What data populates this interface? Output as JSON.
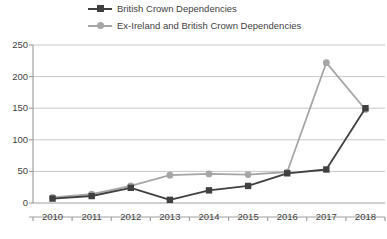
{
  "chart_data": {
    "type": "line",
    "title": "",
    "xlabel": "",
    "ylabel": "",
    "categories": [
      "2010",
      "2011",
      "2012",
      "2013",
      "2014",
      "2015",
      "2016",
      "2017",
      "2018"
    ],
    "ylim": [
      0,
      250
    ],
    "yticks": [
      0,
      50,
      100,
      150,
      200,
      250
    ],
    "grid": true,
    "legend_position": "top",
    "series": [
      {
        "name": "British Crown Dependencies",
        "color": "#404040",
        "marker": "square",
        "values": [
          7,
          11,
          24,
          5,
          20,
          27,
          47,
          53,
          150
        ]
      },
      {
        "name": "Ex-Ireland and British Crown Dependencies",
        "color": "#a6a6a6",
        "marker": "circle",
        "values": [
          9,
          14,
          27,
          44,
          46,
          45,
          49,
          222,
          148
        ]
      }
    ]
  },
  "legend": {
    "items": [
      {
        "label": "British Crown Dependencies",
        "color": "#404040",
        "marker": "square"
      },
      {
        "label": "Ex-Ireland and British Crown Dependencies",
        "color": "#a6a6a6",
        "marker": "circle"
      }
    ]
  },
  "axes": {
    "y_tick_labels": [
      "250",
      "200",
      "150",
      "100",
      "50",
      "0"
    ],
    "x_tick_labels": [
      "2010",
      "2011",
      "2012",
      "2013",
      "2014",
      "2015",
      "2016",
      "2017",
      "2018"
    ]
  }
}
